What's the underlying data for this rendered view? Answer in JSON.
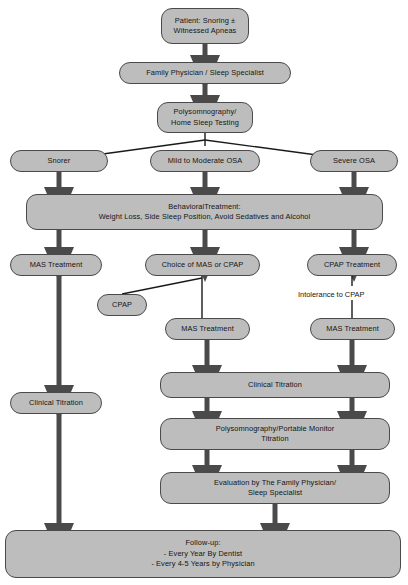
{
  "diagram": {
    "colors": {
      "node_fill": "#bdbdbd",
      "node_border": "#4a4a4a",
      "arrow": "#4a4a4a",
      "line": "#1a1a1a",
      "background": "#ffffff",
      "text": "#141414"
    },
    "nodes": [
      {
        "id": "patient",
        "label": "Patient: Snoring ±\nWitnessed Apneas",
        "x": 161,
        "y": 8,
        "w": 88,
        "h": 36
      },
      {
        "id": "family1",
        "label": "Family Physician / Sleep Specialist",
        "x": 119,
        "y": 62,
        "w": 172,
        "h": 22
      },
      {
        "id": "psg",
        "label": "Polysomnography/\nHome Sleep Testing",
        "x": 157,
        "y": 102,
        "w": 96,
        "h": 31
      },
      {
        "id": "snorer",
        "label": "Snorer",
        "x": 10,
        "y": 150,
        "w": 98,
        "h": 22
      },
      {
        "id": "mildmod",
        "label": "Mild to Moderate OSA",
        "x": 150,
        "y": 150,
        "w": 110,
        "h": 22
      },
      {
        "id": "severe",
        "label": "Severe OSA",
        "x": 310,
        "y": 150,
        "w": 88,
        "h": 22
      },
      {
        "id": "behavioral",
        "label": "BehavioralTreatment:\nWeight Loss, Side Sleep Position, Avoid Sedatives and Alcohol",
        "x": 26,
        "y": 194,
        "w": 357,
        "h": 36
      },
      {
        "id": "mas_left",
        "label": "MAS Treatment",
        "x": 10,
        "y": 254,
        "w": 92,
        "h": 22
      },
      {
        "id": "choice",
        "label": "Choice of MAS or CPAP",
        "x": 145,
        "y": 254,
        "w": 115,
        "h": 22
      },
      {
        "id": "cpap_treat",
        "label": "CPAP Treatment",
        "x": 307,
        "y": 254,
        "w": 90,
        "h": 22
      },
      {
        "id": "cpap_box",
        "label": "CPAP",
        "x": 97,
        "y": 294,
        "w": 50,
        "h": 22
      },
      {
        "id": "mas_mid",
        "label": "MAS Treatment",
        "x": 165,
        "y": 318,
        "w": 85,
        "h": 22
      },
      {
        "id": "mas_right",
        "label": "MAS Treatment",
        "x": 310,
        "y": 318,
        "w": 85,
        "h": 22
      },
      {
        "id": "clin_left",
        "label": "Clinical Titration",
        "x": 10,
        "y": 392,
        "w": 92,
        "h": 22
      },
      {
        "id": "clin_mid",
        "label": "Clinical Titration",
        "x": 160,
        "y": 372,
        "w": 230,
        "h": 26
      },
      {
        "id": "psg_titration",
        "label": "Polysomnography/Portable Monitor\nTitration",
        "x": 160,
        "y": 418,
        "w": 230,
        "h": 32
      },
      {
        "id": "evaluation",
        "label": "Evaluation by The Family Physician/\nSleep Specialist",
        "x": 160,
        "y": 472,
        "w": 230,
        "h": 32
      },
      {
        "id": "followup",
        "label": "Follow-up:\n- Every Year By Dentist\n- Every 4-5 Years by Physician",
        "x": 5,
        "y": 530,
        "w": 396,
        "h": 48
      }
    ],
    "edge_labels": [
      {
        "id": "intolerance",
        "text": "Intolerance to CPAP",
        "x": 296,
        "y": 290
      }
    ],
    "caption": {
      "text": "",
      "x": 2,
      "y": 579
    }
  }
}
